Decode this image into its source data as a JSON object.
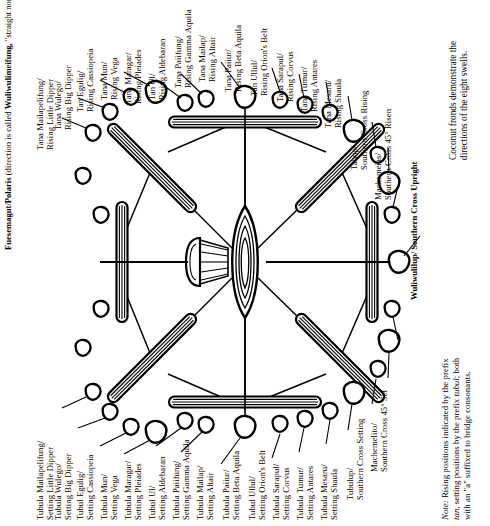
{
  "figure": {
    "caption": [
      "Coconut fronds demonstrate the",
      "directions of the eight swells."
    ],
    "note_lead": "Note:",
    "note": [
      " Rising positions indicated by the prefix",
      "tan, setting positions by the prefix tubul; both",
      "with an \"a\" suffixed to bridge consonants."
    ],
    "note_italic_1": "tan",
    "note_italic_2": "tubul",
    "polaris": [
      "Fuesemagut/Polaris",
      "(direction is called",
      "Wuliwulimeifung,",
      "\"straight north\")"
    ],
    "south": [
      "Wuliwulilup/",
      "Southern Cross",
      "Upright"
    ]
  },
  "labels": {
    "rising": [
      {
        "l1": "Tana Mailapelifung/",
        "l2": "Rising Little Dipper"
      },
      {
        "l1": "Tana Wulego/",
        "l2": "Rising Big Dipper"
      },
      {
        "l1": "Tan Egulig/",
        "l2": "Rising Cassiopeia"
      },
      {
        "l1": "Tana Mun/",
        "l2": "Rising Vega"
      },
      {
        "l1": "Tana Maragar/",
        "l2": "Rising Pleiades"
      },
      {
        "l1": "Tan Ul/",
        "l2": "Rising Aldebaran"
      },
      {
        "l1": "Tana Paiifung/",
        "l2": "Rising Gamma Aquila"
      },
      {
        "l1": "Tana Mailap/",
        "l2": "Rising Altair"
      },
      {
        "l1": "Tana Paiiur/",
        "l2": "Rising Beta Aquila"
      },
      {
        "l1": "Tan Ullul/",
        "l2": "Rising Orion's Belt"
      },
      {
        "l1": "Tana Sarapul/",
        "l2": "Rising Corvus"
      },
      {
        "l1": "Tana Tumur/",
        "l2": "Rising Antares"
      },
      {
        "l1": "Tana Mesaru/",
        "l2": "Rising Shaula"
      },
      {
        "l1": "Tahup/",
        "l2": "Southern Cross Rising"
      },
      {
        "l1": "Machemeias/",
        "l2": "Southern Cross 45° Risen"
      }
    ],
    "setting": [
      {
        "l1": "Tubula Mailapelifung/",
        "l2": "Setting Little Dipper"
      },
      {
        "l1": "Tubula Wulego/",
        "l2": "Setting Big Dipper"
      },
      {
        "l1": "Tubul Egulig/",
        "l2": "Setting Cassiopeia"
      },
      {
        "l1": "Tubula Mun/",
        "l2": "Setting Vega"
      },
      {
        "l1": "Tubula Maragar/",
        "l2": "Setting Pleiades"
      },
      {
        "l1": "Tubul Ul/",
        "l2": "Setting Aldebaran"
      },
      {
        "l1": "Tubula Paiifung/",
        "l2": "Setting Gamma Aquila"
      },
      {
        "l1": "Tubula Mailap/",
        "l2": "Setting Altair"
      },
      {
        "l1": "Tubula Paiiur/",
        "l2": "Setting Beta Aquila"
      },
      {
        "l1": "Tubul Ullul/",
        "l2": "Setting Orion's Belt"
      },
      {
        "l1": "Tubula Sarapul/",
        "l2": "Setting Corvus"
      },
      {
        "l1": "Tubula Tumur/",
        "l2": "Setting Antares"
      },
      {
        "l1": "Tubula Mesaru/",
        "l2": "Setting Shaula"
      },
      {
        "l1": "Tubulup/",
        "l2": "Southern Cross Setting"
      },
      {
        "l1": "Machemelito/",
        "l2": "Southern Cross 45° Set"
      }
    ]
  },
  "colors": {
    "ink": "#000000",
    "paper": "#ffffff"
  }
}
